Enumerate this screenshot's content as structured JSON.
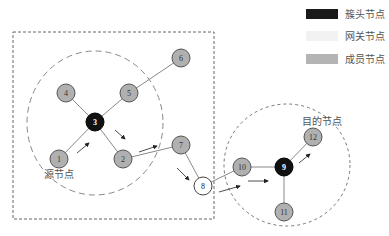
{
  "legend": {
    "items": [
      {
        "label": "簇头节点",
        "type": "cluster-head",
        "color": "#1a1a1a"
      },
      {
        "label": "网关节点",
        "type": "gateway",
        "color": "#f2f2f2"
      },
      {
        "label": "成员节点",
        "type": "member",
        "color": "#b4b4b4"
      }
    ]
  },
  "labels": {
    "source": "源节点",
    "destination": "目的节点"
  },
  "colors": {
    "cluster_head": "#111111",
    "gateway": "#ffffff",
    "member": "#b0b0b0",
    "edge": "#8a8a8a",
    "boundary": "#666666"
  },
  "nodes": [
    {
      "id": "1",
      "label": "1",
      "type": "member",
      "x": 59,
      "y": 159
    },
    {
      "id": "2",
      "label": "2",
      "type": "member",
      "x": 123,
      "y": 159
    },
    {
      "id": "3",
      "label": "3",
      "type": "cluster-head",
      "x": 95,
      "y": 122
    },
    {
      "id": "4",
      "label": "4",
      "type": "member",
      "x": 66,
      "y": 93
    },
    {
      "id": "5",
      "label": "5",
      "type": "member",
      "x": 129,
      "y": 93
    },
    {
      "id": "6",
      "label": "6",
      "type": "member",
      "x": 181,
      "y": 58
    },
    {
      "id": "7",
      "label": "7",
      "type": "member",
      "x": 181,
      "y": 145
    },
    {
      "id": "8",
      "label": "8",
      "type": "gateway",
      "x": 203,
      "y": 186
    },
    {
      "id": "9",
      "label": "9",
      "type": "cluster-head",
      "x": 284,
      "y": 167
    },
    {
      "id": "10",
      "label": "10",
      "type": "member",
      "x": 242,
      "y": 167
    },
    {
      "id": "11",
      "label": "11",
      "type": "member",
      "x": 284,
      "y": 212
    },
    {
      "id": "12",
      "label": "12",
      "type": "member",
      "x": 313,
      "y": 137
    }
  ],
  "edges": [
    [
      "1",
      "3"
    ],
    [
      "4",
      "3"
    ],
    [
      "5",
      "3"
    ],
    [
      "3",
      "2"
    ],
    [
      "5",
      "6"
    ],
    [
      "2",
      "7"
    ],
    [
      "7",
      "8"
    ],
    [
      "8",
      "10"
    ],
    [
      "10",
      "9"
    ],
    [
      "9",
      "12"
    ],
    [
      "9",
      "11"
    ]
  ],
  "route": [
    "1",
    "3",
    "2",
    "7",
    "8",
    "10",
    "9",
    "12"
  ]
}
